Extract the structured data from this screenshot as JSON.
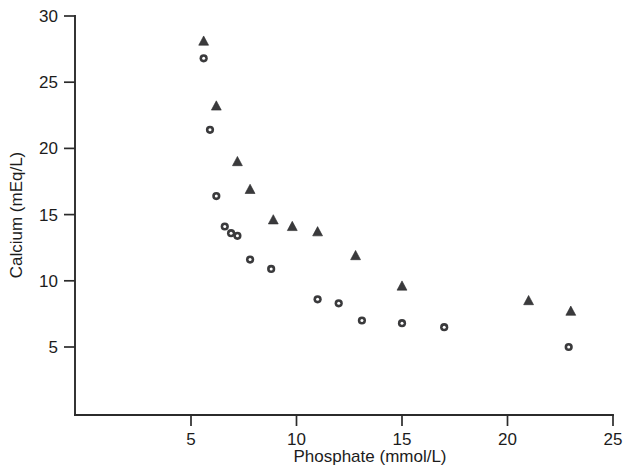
{
  "chart_data": {
    "type": "scatter",
    "title": "",
    "xlabel": "Phosphate (mmol/L)",
    "ylabel": "Calcium (mEq/L)",
    "xlim": [
      0,
      25
    ],
    "ylim": [
      0,
      30
    ],
    "xticks": [
      5,
      10,
      15,
      20,
      25
    ],
    "yticks": [
      5,
      10,
      15,
      20,
      25,
      30
    ],
    "xtick_labels": [
      "5",
      "10",
      "15",
      "20",
      "25"
    ],
    "ytick_labels": [
      "5",
      "10",
      "15",
      "20",
      "25",
      "30"
    ],
    "grid": false,
    "legend": null,
    "legend_position": "none",
    "marker_color": "#3a3a3c",
    "axis_color": "#2b2b2b",
    "background_color": "#ffffff",
    "series": [
      {
        "name": "Triangles",
        "marker": "triangle",
        "color": "#3a3a3c",
        "points": [
          {
            "x": 5.6,
            "y": 28.1
          },
          {
            "x": 6.2,
            "y": 23.2
          },
          {
            "x": 7.2,
            "y": 19.0
          },
          {
            "x": 7.8,
            "y": 16.9
          },
          {
            "x": 8.9,
            "y": 14.6
          },
          {
            "x": 9.8,
            "y": 14.1
          },
          {
            "x": 11.0,
            "y": 13.7
          },
          {
            "x": 12.8,
            "y": 11.9
          },
          {
            "x": 15.0,
            "y": 9.6
          },
          {
            "x": 21.0,
            "y": 8.5
          },
          {
            "x": 23.0,
            "y": 7.7
          }
        ]
      },
      {
        "name": "Circles",
        "marker": "circle",
        "color": "#3a3a3c",
        "points": [
          {
            "x": 5.6,
            "y": 26.8
          },
          {
            "x": 5.9,
            "y": 21.4
          },
          {
            "x": 6.2,
            "y": 16.4
          },
          {
            "x": 6.6,
            "y": 14.1
          },
          {
            "x": 6.9,
            "y": 13.6
          },
          {
            "x": 7.2,
            "y": 13.4
          },
          {
            "x": 7.8,
            "y": 11.6
          },
          {
            "x": 8.8,
            "y": 10.9
          },
          {
            "x": 11.0,
            "y": 8.6
          },
          {
            "x": 12.0,
            "y": 8.3
          },
          {
            "x": 13.1,
            "y": 7.0
          },
          {
            "x": 15.0,
            "y": 6.8
          },
          {
            "x": 17.0,
            "y": 6.5
          },
          {
            "x": 22.9,
            "y": 5.0
          }
        ]
      }
    ]
  }
}
